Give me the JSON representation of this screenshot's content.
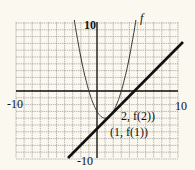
{
  "chart_data": {
    "type": "line",
    "title": "",
    "xlabel": "",
    "ylabel": "",
    "xlim": [
      -10,
      10
    ],
    "ylim": [
      -10,
      10
    ],
    "grid": true,
    "grid_step": 1,
    "tick_labels": {
      "x_left": "-10",
      "x_right": "10",
      "y_top": "10",
      "y_bottom": "-10"
    },
    "series": [
      {
        "name": "f",
        "kind": "parabola",
        "description": "upward parabola, vertex near (1, -4)",
        "points": [
          [
            -2.7,
            10
          ],
          [
            -1,
            0
          ],
          [
            0,
            -3
          ],
          [
            1,
            -4
          ],
          [
            2,
            -3
          ],
          [
            3,
            0
          ],
          [
            4.7,
            10
          ]
        ]
      },
      {
        "name": "secant line",
        "kind": "line",
        "description": "line through (1, f(1)) and (2, f(2))",
        "points": [
          [
            -3.6,
            -10
          ],
          [
            10.6,
            7.2
          ]
        ]
      }
    ],
    "annotations": [
      {
        "text": "f",
        "near": [
          5,
          10.5
        ]
      },
      {
        "text": "2, f(2))",
        "near": [
          2.2,
          -3
        ]
      },
      {
        "text": "(1, f(1))",
        "near": [
          1,
          -5.5
        ]
      }
    ],
    "legend": null
  },
  "labels": {
    "curve_name": "f",
    "point2": "2, f(2))",
    "point1": "(1, f(1))",
    "x_left": "-10",
    "x_right": "10",
    "y_top": "10",
    "y_bottom": "-10"
  },
  "colors": {
    "background": "#fbf8ef",
    "grid": "#8a8a8a",
    "axis": "#111111",
    "curve": "#333333",
    "line": "#111111"
  }
}
